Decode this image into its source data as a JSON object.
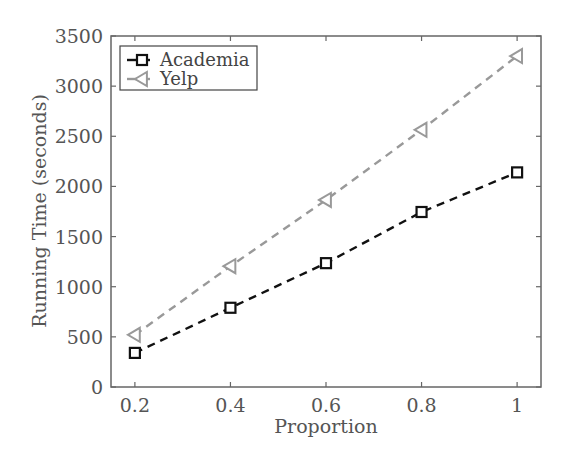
{
  "chart_data": {
    "type": "line",
    "title": "",
    "xlabel": "Proportion",
    "ylabel": "Running Time (seconds)",
    "x": [
      0.2,
      0.4,
      0.6,
      0.8,
      1
    ],
    "xticks": [
      "0.2",
      "0.4",
      "0.6",
      "0.8",
      "1"
    ],
    "yticks": [
      "0",
      "500",
      "1000",
      "1500",
      "2000",
      "2500",
      "3000",
      "3500"
    ],
    "xlim": [
      0.15,
      1.05
    ],
    "ylim": [
      0,
      3500
    ],
    "grid": false,
    "legend_position": "upper left",
    "series": [
      {
        "name": "Academia",
        "values": [
          340,
          790,
          1235,
          1745,
          2140
        ],
        "color": "#111111",
        "marker": "square",
        "linestyle": "dashed"
      },
      {
        "name": "Yelp",
        "values": [
          520,
          1205,
          1865,
          2565,
          3300
        ],
        "color": "#999999",
        "marker": "triangle-left",
        "linestyle": "dashed"
      }
    ]
  }
}
